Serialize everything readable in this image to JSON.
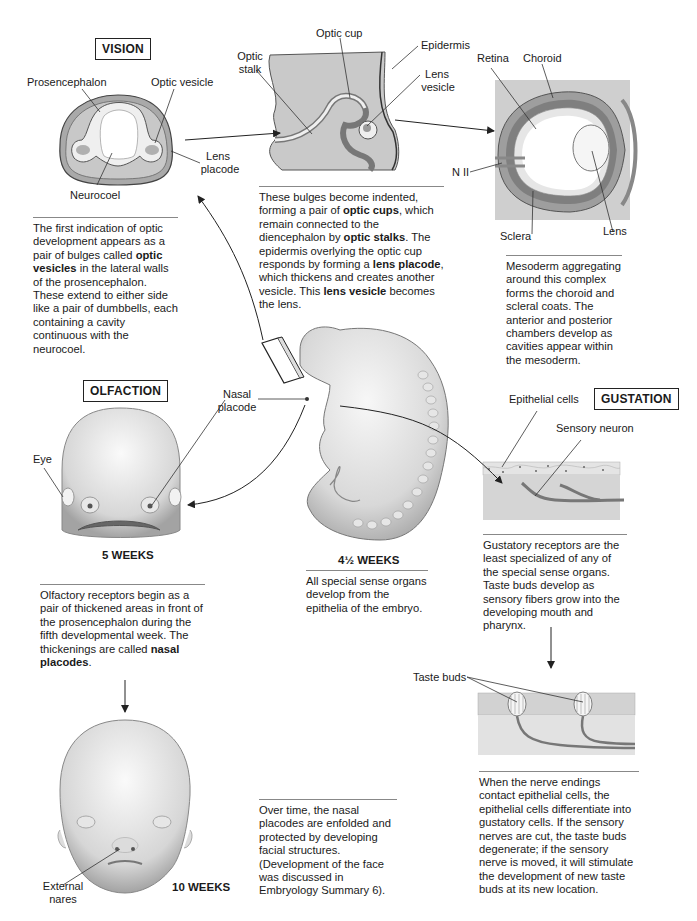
{
  "sections": {
    "vision": {
      "title": "VISION",
      "stage1": {
        "labels": {
          "prosencephalon": "Prosencephalon",
          "optic_vesicle": "Optic vesicle",
          "lens_placode_1": "Lens",
          "lens_placode_2": "placode",
          "neurocoel": "Neurocoel"
        },
        "caption_parts": [
          {
            "text": "The first indication of optic development appears as a pair of bulges called ",
            "bold": false
          },
          {
            "text": "optic vesicles",
            "bold": true
          },
          {
            "text": " in the lateral walls of the prosencephalon. These extend to either side like a pair of dumbbells, each containing a cavity continuous with the neurocoel.",
            "bold": false
          }
        ]
      },
      "stage2": {
        "labels": {
          "optic_cup": "Optic cup",
          "optic_stalk_1": "Optic",
          "optic_stalk_2": "stalk",
          "epidermis": "Epidermis",
          "lens_vesicle_1": "Lens",
          "lens_vesicle_2": "vesicle"
        },
        "caption_parts": [
          {
            "text": "These bulges become indented, forming a pair of ",
            "bold": false
          },
          {
            "text": "optic cups",
            "bold": true
          },
          {
            "text": ", which remain connected to the diencephalon by ",
            "bold": false
          },
          {
            "text": "optic stalks",
            "bold": true
          },
          {
            "text": ". The epidermis overlying the optic cup responds by forming a ",
            "bold": false
          },
          {
            "text": "lens placode",
            "bold": true
          },
          {
            "text": ", which thickens and creates another vesicle. This ",
            "bold": false
          },
          {
            "text": "lens vesicle",
            "bold": true
          },
          {
            "text": " becomes the lens.",
            "bold": false
          }
        ]
      },
      "stage3": {
        "labels": {
          "retina": "Retina",
          "choroid": "Choroid",
          "n_ii": "N II",
          "sclera": "Sclera",
          "lens": "Lens"
        },
        "caption_parts": [
          {
            "text": "Mesoderm aggregating around this complex forms the choroid and scleral coats. The anterior and posterior chambers develop as cavities appear within the mesoderm.",
            "bold": false
          }
        ]
      }
    },
    "embryo": {
      "weeks": "4½ WEEKS",
      "label_nasal_1": "Nasal",
      "label_nasal_2": "placode",
      "caption_parts": [
        {
          "text": "All special sense organs develop from the epithelia of the embryo.",
          "bold": false
        }
      ]
    },
    "olfaction": {
      "title": "OLFACTION",
      "stage1": {
        "weeks": "5 WEEKS",
        "labels": {
          "eye": "Eye"
        },
        "caption_parts": [
          {
            "text": "Olfactory receptors begin as a pair of thickened areas in front of the prosencephalon during the fifth developmental week. The thickenings are called ",
            "bold": false
          },
          {
            "text": "nasal placodes",
            "bold": true
          },
          {
            "text": ".",
            "bold": false
          }
        ]
      },
      "stage2": {
        "weeks": "10 WEEKS",
        "labels": {
          "external_nares_1": "External",
          "external_nares_2": "nares"
        },
        "caption_parts": [
          {
            "text": "Over time, the nasal placodes are enfolded and protected by developing facial structures. (Development of the face was discussed in Embryology Summary 6).",
            "bold": false
          }
        ]
      }
    },
    "gustation": {
      "title": "GUSTATION",
      "stage1": {
        "labels": {
          "epithelial_cells": "Epithelial cells",
          "sensory_neuron": "Sensory neuron"
        },
        "caption_parts": [
          {
            "text": "Gustatory receptors are the least specialized of any of the special sense organs. Taste buds develop as sensory fibers grow into the developing mouth and pharynx.",
            "bold": false
          }
        ]
      },
      "stage2": {
        "labels": {
          "taste_buds": "Taste buds"
        },
        "caption_parts": [
          {
            "text": "When the nerve endings contact epithelial cells, the epithelial cells differentiate into gustatory cells. If the sensory nerves are cut, the taste buds degenerate; if the sensory nerve is moved, it will stimulate the development of new taste buds at its new location.",
            "bold": false
          }
        ]
      }
    }
  },
  "colors": {
    "tissue_dark": "#9a9a9a",
    "tissue_mid": "#bdbdbd",
    "tissue_light": "#e2e2e2",
    "skin": "#d9d9d9",
    "line": "#333333",
    "rule": "#888888"
  }
}
